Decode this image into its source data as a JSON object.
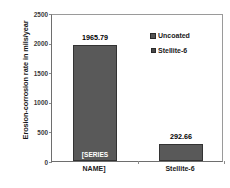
{
  "chart_data": {
    "type": "bar",
    "title": "",
    "xlabel": "",
    "ylabel": "Erosion-corrosion rate in mils/year",
    "categories": [
      "[SERIES NAME]",
      "Stellite-6"
    ],
    "values": [
      1965.79,
      292.66
    ],
    "data_labels": [
      "1965.79",
      "292.66"
    ],
    "ylim": [
      0,
      2500
    ],
    "ytick_labels": [
      "0",
      "500",
      "1000",
      "1500",
      "2000",
      "2500"
    ],
    "ytick_values": [
      0,
      500,
      1000,
      1500,
      2000,
      2500
    ],
    "grid": false,
    "legend_position": "top-right-inside",
    "legend": [
      {
        "label": "Uncoated",
        "swatch": "patterned-square-icon",
        "color": "#595959"
      },
      {
        "label": "Stellite-6",
        "swatch": "solid-square-icon",
        "color": "#4a4a4a"
      }
    ],
    "series": [
      {
        "name": "Uncoated",
        "values": [
          1965.79,
          292.66
        ],
        "color": "#595959"
      }
    ],
    "bar_inner_labels": [
      "[SERIES",
      ""
    ],
    "xtick_labels": [
      "NAME]",
      "Stellite-6"
    ],
    "colors": {
      "bar_fill": "#595959",
      "bar_border": "#333333",
      "axis": "#6e6e6e",
      "plot_border": "#9a9a9a",
      "text": "#1a1a1a",
      "tick_text": "#3a3a3a",
      "background": "#ffffff"
    }
  }
}
